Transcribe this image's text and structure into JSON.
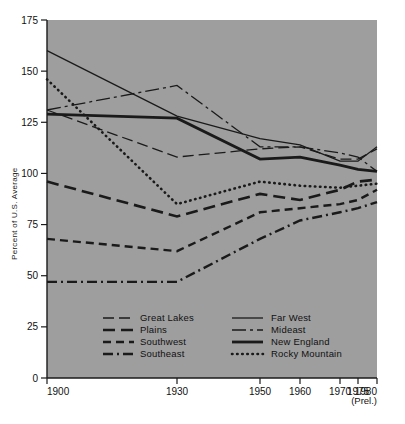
{
  "chart_data": {
    "type": "line",
    "title": "",
    "xlabel": "",
    "ylabel": "Percent of U.S. Average",
    "x": [
      1900,
      1930,
      1950,
      1960,
      1970,
      1975,
      1980
    ],
    "xtick_labels": [
      "1900",
      "1930",
      "1950",
      "1960",
      "1970",
      "1975",
      "1980"
    ],
    "x_note": "(Prel.)",
    "xlim": [
      1900,
      1980
    ],
    "ylim": [
      0,
      175
    ],
    "ytick_labels": [
      "0",
      "25",
      "50",
      "75",
      "100",
      "125",
      "150",
      "175"
    ],
    "yticks": [
      0,
      25,
      50,
      75,
      100,
      125,
      150,
      175
    ],
    "grid": false,
    "legend_position": "lower-center",
    "plot_background": "#9e9e9e",
    "line_color": "#1a1a1a",
    "series": [
      {
        "name": "Great Lakes",
        "style": "long-dash",
        "values": [
          131,
          108,
          112,
          113,
          107,
          107,
          112
        ]
      },
      {
        "name": "Plains",
        "style": "dash",
        "values": [
          96,
          79,
          90,
          87,
          92,
          96,
          97
        ]
      },
      {
        "name": "Southwest",
        "style": "medium-dash",
        "values": [
          68,
          62,
          81,
          83,
          85,
          87,
          92
        ]
      },
      {
        "name": "Southeast",
        "style": "dash-dot",
        "values": [
          47,
          47,
          68,
          77,
          81,
          83,
          86
        ]
      },
      {
        "name": "Far West",
        "style": "solid-thin",
        "values": [
          160,
          128,
          117,
          114,
          106,
          106,
          113
        ]
      },
      {
        "name": "Mideast",
        "style": "dash-dot-long",
        "values": [
          131,
          143,
          113,
          113,
          110,
          108,
          101
        ]
      },
      {
        "name": "New England",
        "style": "solid-thick",
        "values": [
          129,
          127,
          107,
          108,
          104,
          102,
          101
        ]
      },
      {
        "name": "Rocky Mountain",
        "style": "dotted",
        "values": [
          146,
          85,
          96,
          94,
          93,
          94,
          95
        ]
      }
    ]
  },
  "legend": {
    "column_left": [
      "Great Lakes",
      "Plains",
      "Southwest",
      "Southeast"
    ],
    "column_right": [
      "Far West",
      "Mideast",
      "New England",
      "Rocky Mountain"
    ]
  }
}
